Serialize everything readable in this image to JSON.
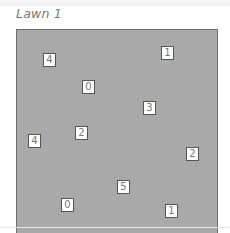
{
  "title": "Lawn 1",
  "colors": {
    "lawn_fill": "#a9a9a9",
    "lawn_border": "#6f6f6f",
    "marker_fill": "#ffffff",
    "marker_border": "#555555",
    "title_text": "#777777"
  },
  "markers": [
    {
      "value": "4",
      "x": 43,
      "y": 53
    },
    {
      "value": "0",
      "x": 82,
      "y": 80
    },
    {
      "value": "1",
      "x": 161,
      "y": 46
    },
    {
      "value": "3",
      "x": 143,
      "y": 101
    },
    {
      "value": "2",
      "x": 75,
      "y": 126
    },
    {
      "value": "4",
      "x": 28,
      "y": 134
    },
    {
      "value": "2",
      "x": 186,
      "y": 147
    },
    {
      "value": "5",
      "x": 117,
      "y": 180
    },
    {
      "value": "0",
      "x": 61,
      "y": 198
    },
    {
      "value": "1",
      "x": 165,
      "y": 204
    }
  ]
}
